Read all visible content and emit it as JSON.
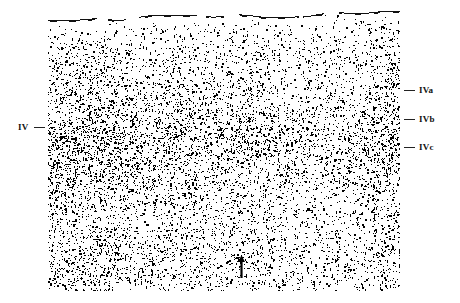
{
  "figure": {
    "type": "histology-micrograph",
    "plate": {
      "x": 48,
      "y": 10,
      "width": 352,
      "height": 281,
      "background_color": "#ffffff",
      "stain_color": "#000000",
      "pial_surface": true
    }
  },
  "annotations": {
    "left": [
      {
        "id": "IV",
        "label": "IV",
        "tick_y": 127,
        "side": "left"
      }
    ],
    "right": [
      {
        "id": "IVa",
        "label": "IVa",
        "tick_y": 90,
        "side": "right"
      },
      {
        "id": "IVb",
        "label": "IVb",
        "tick_y": 119,
        "side": "right"
      },
      {
        "id": "IVc",
        "label": "IVc",
        "tick_y": 147,
        "side": "right"
      }
    ],
    "markers": [
      {
        "id": "arrow",
        "glyph": "up-arrow",
        "x": 193,
        "y": 256,
        "color": "#000000"
      }
    ]
  },
  "chart_data": {
    "type": "heatmap",
    "title": "",
    "xlabel": "",
    "ylabel": "",
    "legend_position": "right",
    "grid": false,
    "categories": [
      "IVa",
      "IVb",
      "IVc"
    ],
    "series": [
      {
        "name": "cell packing density (relative)",
        "x": [
          0.0,
          0.04,
          0.09,
          0.14,
          0.19,
          0.24,
          0.28,
          0.32,
          0.36,
          0.4,
          0.44,
          0.48,
          0.52,
          0.56,
          0.6,
          0.65,
          0.7,
          0.75,
          0.8,
          0.85,
          0.9,
          0.95,
          1.0
        ],
        "values": [
          0.1,
          0.3,
          0.44,
          0.52,
          0.58,
          0.62,
          0.66,
          0.72,
          0.8,
          0.9,
          0.97,
          1.0,
          0.94,
          0.84,
          0.74,
          0.66,
          0.6,
          0.58,
          0.6,
          0.64,
          0.66,
          0.62,
          0.52
        ]
      }
    ],
    "ylim": [
      0,
      1
    ],
    "band_boundaries": [
      {
        "label": "IVa",
        "depth_fraction": 0.285
      },
      {
        "label": "IVb",
        "depth_fraction": 0.388
      },
      {
        "label": "IVc",
        "depth_fraction": 0.488
      }
    ]
  },
  "render": {
    "seed": 20240517,
    "pial_line_color": "#101010",
    "cell_color": "#000000"
  }
}
